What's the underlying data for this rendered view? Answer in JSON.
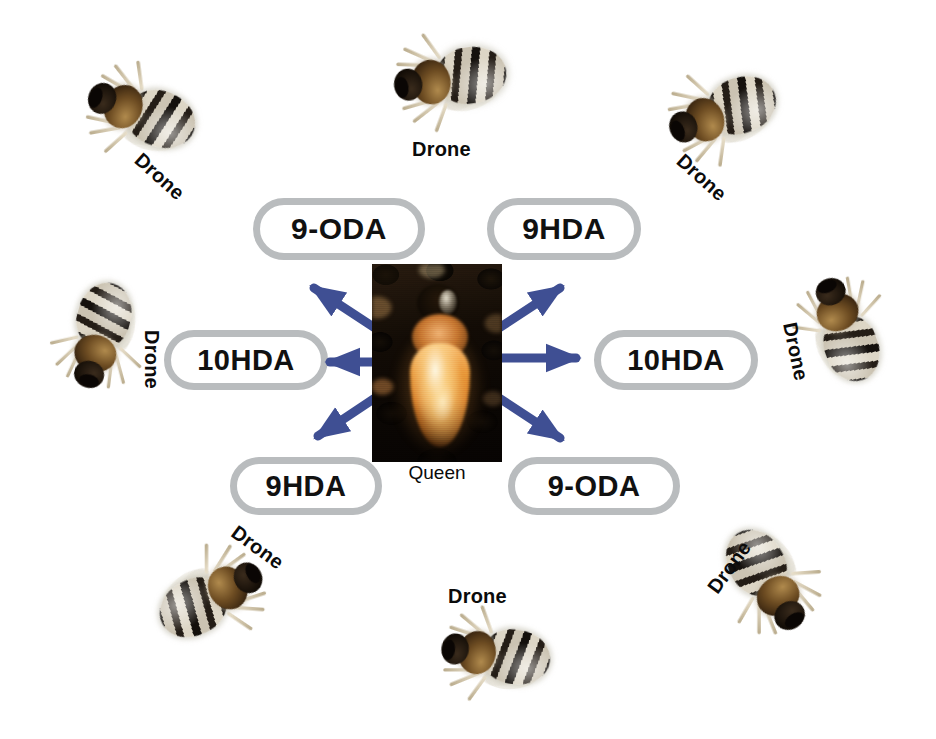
{
  "figure": {
    "background": "#ffffff",
    "arrow_color": "#3f4f93",
    "pill_border_color": "#b9bcbe",
    "pill_fill_color": "#ffffff",
    "label_color": "#0b0b0b"
  },
  "center": {
    "photo_name": "queen-bee-photograph",
    "caption": "Queen"
  },
  "pheromones": [
    {
      "label": "9-ODA",
      "position": "top-left",
      "left": 253,
      "top": 198,
      "width": 172,
      "height": 62,
      "font_size": 30
    },
    {
      "label": "9HDA",
      "position": "top-right",
      "left": 487,
      "top": 198,
      "width": 154,
      "height": 62,
      "font_size": 30
    },
    {
      "label": "10HDA",
      "position": "middle-left",
      "left": 164,
      "top": 330,
      "width": 164,
      "height": 60,
      "font_size": 29
    },
    {
      "label": "10HDA",
      "position": "middle-right",
      "left": 594,
      "top": 330,
      "width": 164,
      "height": 60,
      "font_size": 29
    },
    {
      "label": "9HDA",
      "position": "bottom-left",
      "left": 230,
      "top": 457,
      "width": 152,
      "height": 58,
      "font_size": 29
    },
    {
      "label": "9-ODA",
      "position": "bottom-right",
      "left": 508,
      "top": 457,
      "width": 172,
      "height": 58,
      "font_size": 29
    }
  ],
  "arrows": [
    {
      "name": "arrow-upper-left",
      "x1": 378,
      "y1": 330,
      "x2": 314,
      "y2": 288
    },
    {
      "name": "arrow-left",
      "x1": 372,
      "y1": 362,
      "x2": 330,
      "y2": 362
    },
    {
      "name": "arrow-lower-left",
      "x1": 378,
      "y1": 396,
      "x2": 318,
      "y2": 436
    },
    {
      "name": "arrow-upper-right",
      "x1": 496,
      "y1": 330,
      "x2": 560,
      "y2": 288
    },
    {
      "name": "arrow-right",
      "x1": 500,
      "y1": 358,
      "x2": 576,
      "y2": 358
    },
    {
      "name": "arrow-lower-right",
      "x1": 496,
      "y1": 396,
      "x2": 560,
      "y2": 438
    }
  ],
  "drones": [
    {
      "label": "Drone",
      "position": "top-center",
      "bee_left": 400,
      "bee_top": 38,
      "bee_rot": 172,
      "bee_scale": 1.18,
      "label_left": 412,
      "label_top": 138,
      "label_rot": 0
    },
    {
      "label": "Drone",
      "position": "top-left",
      "bee_left": 92,
      "bee_top": 72,
      "bee_rot": 200,
      "bee_scale": 1.16,
      "label_left": 130,
      "label_top": 165,
      "label_rot": 42
    },
    {
      "label": "Drone",
      "position": "top-right",
      "bee_left": 672,
      "bee_top": 72,
      "bee_rot": 160,
      "bee_scale": 1.16,
      "label_left": 672,
      "label_top": 166,
      "label_rot": 42
    },
    {
      "label": "Drone",
      "position": "middle-left",
      "bee_left": 48,
      "bee_top": 296,
      "bee_rot": 105,
      "bee_scale": 1.12,
      "label_left": 122,
      "label_top": 348,
      "label_rot": 90
    },
    {
      "label": "Drone",
      "position": "middle-right",
      "bee_left": 796,
      "bee_top": 290,
      "bee_rot": 250,
      "bee_scale": 1.12,
      "label_left": 766,
      "label_top": 340,
      "label_rot": 78
    },
    {
      "label": "Drone",
      "position": "bottom-left",
      "bee_left": 162,
      "bee_top": 560,
      "bee_rot": 332,
      "bee_scale": 1.16,
      "label_left": 228,
      "label_top": 536,
      "label_rot": 36
    },
    {
      "label": "Drone",
      "position": "bottom-center",
      "bee_left": 446,
      "bee_top": 614,
      "bee_rot": 188,
      "bee_scale": 1.14,
      "label_left": 448,
      "label_top": 585,
      "label_rot": 0
    },
    {
      "label": "Drone",
      "position": "bottom-right",
      "bee_left": 716,
      "bee_top": 542,
      "bee_rot": 58,
      "bee_scale": 1.16,
      "label_left": 700,
      "label_top": 556,
      "label_rot": -54
    }
  ]
}
